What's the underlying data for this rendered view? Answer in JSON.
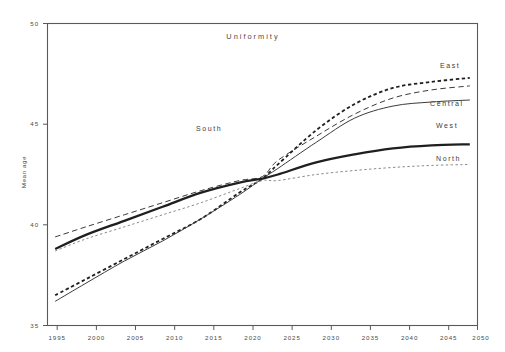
{
  "chart_data": {
    "type": "line",
    "title": "Uniformity",
    "xlabel": "",
    "ylabel": "Mean age",
    "xlim": [
      1995,
      2051
    ],
    "ylim": [
      35,
      50
    ],
    "grid": false,
    "legend_position": "inline-right",
    "x_ticks": [
      1995,
      2000,
      2005,
      2010,
      2015,
      2020,
      2025,
      2030,
      2035,
      2040,
      2045,
      2050
    ],
    "y_ticks": [
      35,
      40,
      45,
      50
    ],
    "x": [
      1996,
      2000,
      2005,
      2010,
      2015,
      2020,
      2023,
      2025,
      2030,
      2035,
      2040,
      2045,
      2050
    ],
    "series": [
      {
        "name": "East",
        "style": "dotted",
        "values": [
          36.5,
          37.3,
          38.3,
          39.3,
          40.3,
          41.6,
          42.3,
          43.0,
          44.7,
          46.0,
          46.8,
          47.1,
          47.3
        ]
      },
      {
        "name": "South",
        "style": "dashed",
        "values": [
          39.4,
          39.9,
          40.5,
          41.1,
          41.7,
          42.2,
          42.4,
          43.2,
          44.4,
          45.5,
          46.3,
          46.7,
          46.9
        ]
      },
      {
        "name": "Central",
        "style": "solid-thin",
        "values": [
          36.2,
          37.1,
          38.2,
          39.2,
          40.3,
          41.5,
          42.3,
          42.8,
          44.1,
          45.3,
          45.9,
          46.1,
          46.2
        ]
      },
      {
        "name": "West",
        "style": "solid-thick",
        "values": [
          38.8,
          39.5,
          40.2,
          40.9,
          41.6,
          42.1,
          42.3,
          42.5,
          43.1,
          43.5,
          43.8,
          43.95,
          44.0
        ]
      },
      {
        "name": "North",
        "style": "dotted-light",
        "values": [
          38.7,
          39.3,
          39.9,
          40.5,
          41.1,
          41.8,
          42.2,
          42.2,
          42.5,
          42.7,
          42.85,
          42.95,
          43.0
        ]
      }
    ],
    "series_labels": [
      {
        "name": "East",
        "x_px": 440,
        "y_px": 68
      },
      {
        "name": "South",
        "x_px": 196,
        "y_px": 131
      },
      {
        "name": "Central",
        "x_px": 430,
        "y_px": 106
      },
      {
        "name": "West",
        "x_px": 436,
        "y_px": 128
      },
      {
        "name": "North",
        "x_px": 436,
        "y_px": 161
      }
    ]
  },
  "axes": {
    "y_tick_labels": [
      "50",
      "45",
      "40",
      "35"
    ],
    "x_tick_labels": [
      "1995",
      "2000",
      "2005",
      "2010",
      "2015",
      "2020",
      "2025",
      "2030",
      "2035",
      "2040",
      "2045",
      "2050"
    ],
    "y_axis_title": "Mean age"
  },
  "colors": {
    "frame": "#5a5a5a",
    "text": "#4a4a4a",
    "series_dark": "#1f1f1f",
    "series_mid": "#3b3b3b",
    "series_light": "#8a8a8a",
    "background": "#ffffff"
  }
}
